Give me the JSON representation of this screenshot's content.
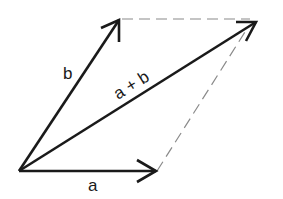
{
  "diagram": {
    "colors": {
      "stroke": "#1a1a1a",
      "dashed": "#8a8a8a",
      "background": "#ffffff"
    },
    "vectors": [
      {
        "id": "a",
        "label": "a"
      },
      {
        "id": "b",
        "label": "b"
      },
      {
        "id": "a_plus_b",
        "label": "a + b"
      }
    ],
    "dashed_edges": [
      "b-tip to a+b-tip",
      "a-tip to a+b-tip"
    ]
  }
}
